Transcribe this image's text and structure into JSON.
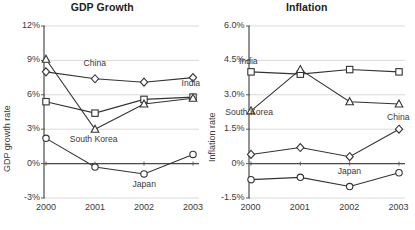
{
  "chart_data": [
    {
      "type": "line",
      "title": "GDP Growth",
      "xlabel": "",
      "ylabel": "GDP growth rate",
      "categories": [
        "2000",
        "2001",
        "2002",
        "2003"
      ],
      "ylim": [
        -3,
        12
      ],
      "yticks": [
        "-3%",
        "0%",
        "3%",
        "6%",
        "9%",
        "12%"
      ],
      "ytick_values": [
        -3,
        0,
        3,
        6,
        9,
        12
      ],
      "grid": true,
      "legend": "inline-labels",
      "series": [
        {
          "name": "China",
          "marker": "diamond",
          "values": [
            8.0,
            7.4,
            7.1,
            7.5
          ],
          "label_x": "2001",
          "label_y": 8.7
        },
        {
          "name": "India",
          "marker": "square",
          "values": [
            5.4,
            4.4,
            5.6,
            5.8
          ],
          "label_x": "2003",
          "label_y": 6.9
        },
        {
          "name": "South Korea",
          "marker": "triangle",
          "values": [
            9.1,
            3.0,
            5.2,
            5.7
          ],
          "label_x": "2001",
          "label_y": 2.1
        },
        {
          "name": "Japan",
          "marker": "circle",
          "values": [
            2.2,
            -0.3,
            -0.9,
            0.8
          ],
          "label_x": "2002",
          "label_y": -1.9
        }
      ]
    },
    {
      "type": "line",
      "title": "Inflation",
      "xlabel": "",
      "ylabel": "Inflation rate",
      "categories": [
        "2000",
        "2001",
        "2002",
        "2003"
      ],
      "ylim": [
        -1.5,
        6.0
      ],
      "yticks": [
        "-1.5%",
        "0%",
        "1.5%",
        "3.0%",
        "4.5%",
        "6.0%"
      ],
      "ytick_values": [
        -1.5,
        0,
        1.5,
        3.0,
        4.5,
        6.0
      ],
      "grid": true,
      "legend": "inline-labels",
      "series": [
        {
          "name": "India",
          "marker": "square",
          "values": [
            4.0,
            3.9,
            4.1,
            4.0
          ],
          "label_x": "2000",
          "label_y": 4.45
        },
        {
          "name": "South Korea",
          "marker": "triangle",
          "values": [
            2.3,
            4.1,
            2.7,
            2.6
          ],
          "label_x": "2000",
          "label_y": 2.2
        },
        {
          "name": "China",
          "marker": "diamond",
          "values": [
            0.4,
            0.7,
            0.3,
            1.5
          ],
          "label_x": "2003",
          "label_y": 2.0
        },
        {
          "name": "Japan",
          "marker": "circle",
          "values": [
            -0.7,
            -0.6,
            -1.0,
            -0.4
          ],
          "label_x": "2002",
          "label_y": -0.35
        }
      ]
    }
  ],
  "colors": {
    "line": "#333333",
    "marker_fill": "#ffffff",
    "grid": "#d9d9d9",
    "axis": "#595959",
    "text": "#3a3a3a",
    "background": "#ffffff"
  }
}
